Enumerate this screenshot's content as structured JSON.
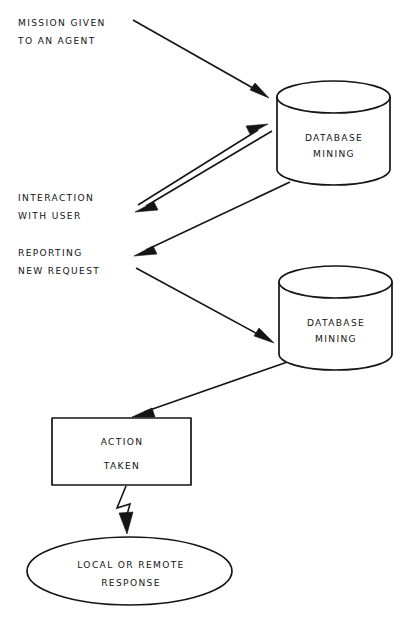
{
  "diagram": {
    "background_color": "#ffffff",
    "line_color": "#151515",
    "annotations": [
      {
        "name": "mission-given-label",
        "lines": [
          "MISSION GIVEN",
          "TO AN AGENT"
        ],
        "x": 18,
        "y": 26
      },
      {
        "name": "interaction-with-user-label",
        "lines": [
          "INTERACTION",
          "WITH USER"
        ],
        "x": 18,
        "y": 201
      },
      {
        "name": "reporting-new-request-label",
        "lines": [
          "REPORTING",
          "NEW REQUEST"
        ],
        "x": 18,
        "y": 256
      }
    ],
    "nodes": [
      {
        "name": "database-mining-cylinder-top",
        "type": "cylinder",
        "lines": [
          "DATABASE",
          "MINING"
        ],
        "x": 277,
        "y": 81,
        "width": 113,
        "height": 104,
        "ellipse_ry": 16
      },
      {
        "name": "database-mining-cylinder-bottom",
        "type": "cylinder",
        "lines": [
          "DATABASE",
          "MINING"
        ],
        "x": 279,
        "y": 266,
        "width": 113,
        "height": 104,
        "ellipse_ry": 16
      },
      {
        "name": "action-taken-box",
        "type": "rectangle",
        "lines": [
          "ACTION",
          "TAKEN"
        ],
        "x": 52,
        "y": 418,
        "width": 139,
        "height": 67
      },
      {
        "name": "local-or-remote-response-ellipse",
        "type": "ellipse",
        "lines": [
          "LOCAL OR REMOTE",
          "RESPONSE"
        ],
        "x": 27,
        "y": 537,
        "width": 205,
        "height": 68
      }
    ],
    "connectors": [
      {
        "name": "arrow-mission-to-database-top",
        "from": "mission-given-label",
        "to": "database-mining-cylinder-top",
        "style": "straight-arrow",
        "direction": "down-right"
      },
      {
        "name": "arrow-interaction-to-database-top",
        "from": "interaction-with-user-label",
        "to": "database-mining-cylinder-top",
        "style": "straight-arrow",
        "direction": "up-right"
      },
      {
        "name": "arrow-database-top-to-interaction",
        "from": "database-mining-cylinder-top",
        "to": "interaction-with-user-label",
        "style": "straight-arrow",
        "direction": "down-left"
      },
      {
        "name": "arrow-database-top-to-reporting",
        "from": "database-mining-cylinder-top",
        "to": "reporting-new-request-label",
        "style": "straight-arrow",
        "direction": "down-left"
      },
      {
        "name": "arrow-reporting-to-database-bottom",
        "from": "reporting-new-request-label",
        "to": "database-mining-cylinder-bottom",
        "style": "straight-arrow",
        "direction": "down-right"
      },
      {
        "name": "arrow-database-bottom-to-action",
        "from": "database-mining-cylinder-bottom",
        "to": "action-taken-box",
        "style": "straight-arrow",
        "direction": "down-left"
      },
      {
        "name": "arrow-action-to-response",
        "from": "action-taken-box",
        "to": "local-or-remote-response-ellipse",
        "style": "zigzag-lightning-arrow",
        "direction": "down"
      }
    ]
  }
}
